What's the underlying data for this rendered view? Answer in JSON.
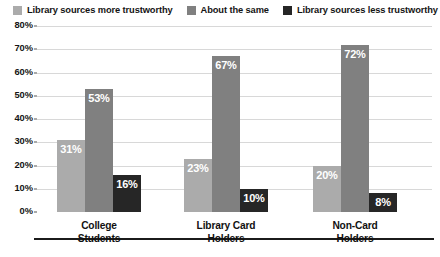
{
  "legend": {
    "position": "top",
    "items": [
      {
        "label": "Library sources more trustworthy",
        "color": "#ababab",
        "swatch_name": "legend-swatch-more-trustworthy"
      },
      {
        "label": "About the same",
        "color": "#808080",
        "swatch_name": "legend-swatch-about-the-same"
      },
      {
        "label": "Library sources less trustworthy",
        "color": "#262626",
        "swatch_name": "legend-swatch-less-trustworthy"
      }
    ]
  },
  "chart_data": {
    "type": "bar",
    "title": "",
    "subtitle": "",
    "xlabel": "",
    "ylabel": "",
    "ylim": [
      0,
      80
    ],
    "grid": true,
    "legend_position": "top",
    "categories": [
      "College Students",
      "Library Card Holders",
      "Non-Card Holders"
    ],
    "category_lines": [
      [
        "College",
        "Students"
      ],
      [
        "Library Card",
        "Holders"
      ],
      [
        "Non-Card",
        "Holders"
      ]
    ],
    "y_ticks": [
      0,
      10,
      20,
      30,
      40,
      50,
      60,
      70,
      80
    ],
    "y_tick_labels": [
      "0%",
      "10%",
      "20%",
      "30%",
      "40%",
      "50%",
      "60%",
      "70%",
      "80%"
    ],
    "series": [
      {
        "name": "Library sources more trustworthy",
        "color": "#ababab",
        "values": [
          31,
          53,
          16
        ],
        "labels": [
          "31%",
          "53%",
          "16%"
        ]
      },
      {
        "name": "About the same",
        "color": "#808080",
        "values": [
          23,
          67,
          10
        ],
        "labels": [
          "23%",
          "67%",
          "10%"
        ]
      },
      {
        "name": "Library sources less trustworthy",
        "color": "#262626",
        "values": [
          20,
          72,
          8
        ],
        "labels": [
          "20%",
          "72%",
          "8%"
        ]
      }
    ],
    "bars_by_group": [
      {
        "category": "College Students",
        "bars": [
          {
            "series": "Library sources more trustworthy",
            "value": 31,
            "label": "31%",
            "color": "#ababab"
          },
          {
            "series": "About the same",
            "value": 53,
            "label": "53%",
            "color": "#808080"
          },
          {
            "series": "Library sources less trustworthy",
            "value": 16,
            "label": "16%",
            "color": "#262626"
          }
        ]
      },
      {
        "category": "Library Card Holders",
        "bars": [
          {
            "series": "Library sources more trustworthy",
            "value": 23,
            "label": "23%",
            "color": "#ababab"
          },
          {
            "series": "About the same",
            "value": 67,
            "label": "67%",
            "color": "#808080"
          },
          {
            "series": "Library sources less trustworthy",
            "value": 10,
            "label": "10%",
            "color": "#262626"
          }
        ]
      },
      {
        "category": "Non-Card Holders",
        "bars": [
          {
            "series": "Library sources more trustworthy",
            "value": 20,
            "label": "20%",
            "color": "#ababab"
          },
          {
            "series": "About the same",
            "value": 72,
            "label": "72%",
            "color": "#808080"
          },
          {
            "series": "Library sources less trustworthy",
            "value": 8,
            "label": "8%",
            "color": "#262626"
          }
        ]
      }
    ]
  },
  "colors": {
    "gridline": "#d8d8d8",
    "axis": "#1b1b1b",
    "text": "#111111",
    "value_label": "#ffffff",
    "background": "#ffffff"
  }
}
